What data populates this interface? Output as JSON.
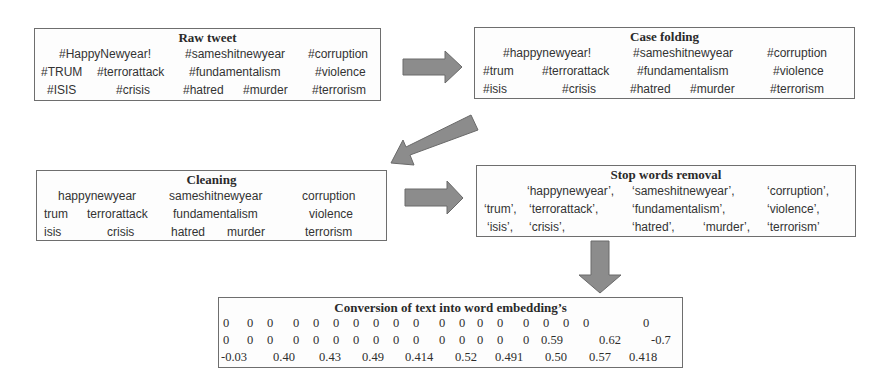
{
  "colors": {
    "arrow_fill": "#8c8c8c",
    "arrow_stroke": "#6a6a6a",
    "border": "#6e6e6e"
  },
  "boxes": {
    "raw_tweet": {
      "title": "Raw tweet",
      "words": [
        "#HappyNewyear!",
        "#sameshitnewyear",
        "#corruption",
        "#TRUM",
        "#terrorattack",
        "#fundamentalism",
        "#violence",
        "#ISIS",
        "#crisis",
        "#hatred",
        "#murder",
        "#terrorism"
      ]
    },
    "case_folding": {
      "title": "Case folding",
      "words": [
        "#happynewyear!",
        "#sameshitnewyear",
        "#corruption",
        "#trum",
        "#terrorattack",
        "#fundamentalism",
        "#violence",
        "#isis",
        "#crisis",
        "#hatred",
        "#murder",
        "#terrorism"
      ]
    },
    "cleaning": {
      "title": "Cleaning",
      "words": [
        "happynewyear",
        "sameshitnewyear",
        "corruption",
        "trum",
        "terrorattack",
        "fundamentalism",
        "violence",
        "isis",
        "crisis",
        "hatred",
        "murder",
        "terrorism"
      ]
    },
    "stop_words": {
      "title": "Stop words removal",
      "words": [
        "‘happynewyear’,",
        "‘sameshitnewyear’,",
        "‘corruption’,",
        "‘trum’,",
        "‘terrorattack’,",
        "‘fundamentalism’,",
        "‘violence’,",
        "‘isis’,",
        "‘crisis’,",
        "‘hatred’,",
        "‘murder’,",
        "‘terrorism’"
      ]
    },
    "embedding": {
      "title": "Conversion of text into word embedding’s",
      "row1": [
        "0",
        "0",
        "0",
        "0",
        "0",
        "0",
        "0",
        "0",
        "0",
        "0",
        "0",
        "0",
        "0",
        "0",
        "0",
        "0",
        "0",
        "0",
        "0"
      ],
      "row2": [
        "0",
        "0",
        "0",
        "0",
        "0",
        "0",
        "0",
        "0",
        "0",
        "0",
        "0",
        "0",
        "0",
        "0",
        "0",
        "0.59",
        "0.62",
        "-0.7"
      ],
      "row3": [
        "-0.03",
        "0.40",
        "0.43",
        "0.49",
        "0.414",
        "0.52",
        "0.491",
        "0.50",
        "0.57",
        "0.418"
      ]
    }
  }
}
